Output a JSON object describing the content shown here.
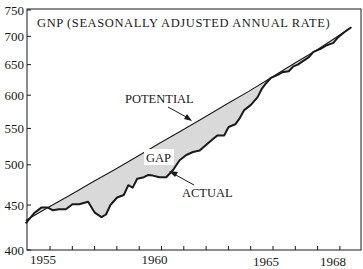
{
  "chart_data": {
    "type": "area",
    "title": "GNP (SEASONALLY ADJUSTED ANNUAL RATE)",
    "xlabel": "",
    "ylabel": "",
    "yscale": "log",
    "ylim": [
      400,
      750
    ],
    "xlim": [
      1954.0,
      1969.0
    ],
    "grid": false,
    "legend": "none",
    "yticks": [
      400,
      450,
      500,
      550,
      600,
      650,
      700,
      750
    ],
    "xticks_labeled": [
      1955,
      1960,
      1965,
      1968
    ],
    "colors": {
      "line": "#1a1a1a",
      "gap_fill": "#d9d9d9",
      "background": "#ffffff"
    },
    "annotations": [
      {
        "text": "POTENTIAL",
        "points_to": "potential line",
        "x": 1958.6,
        "y": 592
      },
      {
        "text": "GAP",
        "points_to": "shaded area between potential and actual",
        "x": 1960.2,
        "y": 503
      },
      {
        "text": "ACTUAL",
        "points_to": "actual line",
        "x": 1961.6,
        "y": 468
      }
    ],
    "series": [
      {
        "name": "POTENTIAL",
        "x": [
          1954.0,
          1955.0,
          1956.0,
          1957.0,
          1958.0,
          1959.0,
          1960.0,
          1961.0,
          1962.0,
          1963.0,
          1964.0,
          1965.0,
          1966.0,
          1967.0,
          1968.0,
          1968.6
        ],
        "values": [
          432,
          447,
          462,
          478,
          494,
          511,
          529,
          547,
          566,
          586,
          606,
          628,
          651,
          674,
          700,
          717
        ]
      },
      {
        "name": "ACTUAL",
        "x": [
          1954.0,
          1954.4,
          1954.7,
          1955.0,
          1955.2,
          1955.5,
          1955.8,
          1956.1,
          1956.4,
          1956.8,
          1957.1,
          1957.4,
          1957.6,
          1957.8,
          1958.1,
          1958.4,
          1958.6,
          1958.8,
          1959.0,
          1959.3,
          1959.5,
          1959.7,
          1960.0,
          1960.3,
          1960.6,
          1960.9,
          1961.2,
          1961.5,
          1961.8,
          1962.1,
          1962.4,
          1962.6,
          1962.9,
          1963.1,
          1963.4,
          1963.6,
          1963.8,
          1964.1,
          1964.4,
          1964.6,
          1964.8,
          1965.0,
          1965.3,
          1965.5,
          1965.8,
          1966.0,
          1966.2,
          1966.4,
          1966.7,
          1966.9,
          1967.2,
          1967.5,
          1967.8,
          1968.0,
          1968.3,
          1968.6
        ],
        "values": [
          429,
          441,
          447,
          447,
          444,
          445,
          445,
          451,
          451,
          454,
          441,
          436,
          439,
          450,
          459,
          462,
          474,
          471,
          482,
          484,
          487,
          486,
          484,
          484,
          493,
          506,
          513,
          517,
          519,
          527,
          535,
          540,
          540,
          552,
          556,
          565,
          577,
          585,
          597,
          611,
          620,
          628,
          633,
          637,
          639,
          647,
          650,
          655,
          663,
          672,
          677,
          684,
          688,
          698,
          708,
          717
        ]
      }
    ]
  }
}
